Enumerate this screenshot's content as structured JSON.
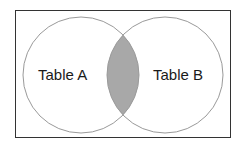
{
  "diagram": {
    "type": "venn",
    "join_type_visualized": "inner join (intersection shaded)",
    "sets": [
      {
        "id": "A",
        "label": "Table A"
      },
      {
        "id": "B",
        "label": "Table B"
      }
    ],
    "highlighted_region": "A ∩ B",
    "colors": {
      "frame": "#333333",
      "circle_stroke": "#9a9a9a",
      "intersection_fill": "#a8a8a8",
      "background": "#ffffff"
    }
  }
}
